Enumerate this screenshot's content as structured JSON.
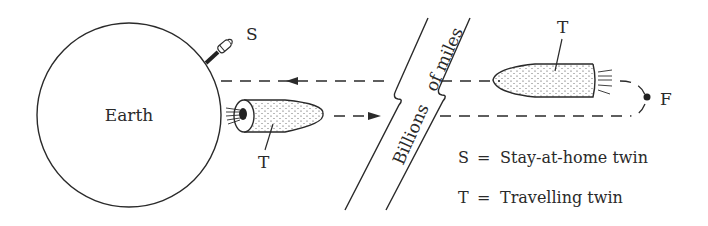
{
  "diagram": {
    "earth": {
      "label": "Earth"
    },
    "stay_at_home_rocket": {
      "label": "S"
    },
    "outbound_rocket": {
      "label": "T"
    },
    "return_rocket": {
      "label": "T"
    },
    "turnaround_point": {
      "label": "F"
    },
    "distance_band": {
      "label": "Billions   of miles"
    },
    "legend": [
      {
        "symbol": "S",
        "equals": "=",
        "meaning": "Stay-at-home twin"
      },
      {
        "symbol": "T",
        "equals": "=",
        "meaning": "Travelling twin"
      }
    ],
    "colors": {
      "ink": "#2a2a2a",
      "background": "#ffffff"
    }
  }
}
